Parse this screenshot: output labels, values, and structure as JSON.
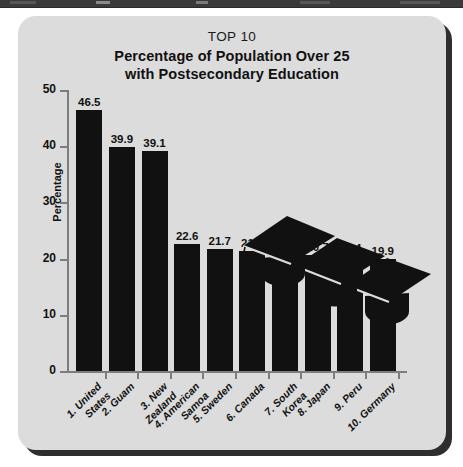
{
  "window": {
    "titlebar_present": true,
    "titlebar_color": "#3a3a3a"
  },
  "card": {
    "background_color": "#dcdcdc",
    "shadow_color": "#2e2e2e"
  },
  "illustration": {
    "name": "graduation-caps",
    "count": 3,
    "color": "#111111"
  },
  "chart_data": {
    "type": "bar",
    "title": "TOP 10",
    "subtitle": "Percentage of Population Over 25\nwith Postsecondary Education",
    "subtitle_line1": "Percentage of Population Over 25",
    "subtitle_line2": "with Postsecondary Education",
    "xlabel": "",
    "ylabel": "Percentage",
    "ylim": [
      0,
      50
    ],
    "yticks": [
      0,
      10,
      20,
      30,
      40,
      50
    ],
    "ytick_labels": [
      "0",
      "10",
      "20",
      "30",
      "40",
      "50"
    ],
    "grid": false,
    "legend": false,
    "bar_color": "#111111",
    "categories": [
      "1. United\nStates",
      "2. Guam",
      "3. New\nZealand",
      "4. American\nSamoa",
      "5. Sweden",
      "6. Canada",
      "7. South\nKorea",
      "8. Japan",
      "9. Peru",
      "10. Germany"
    ],
    "values": [
      46.5,
      39.9,
      39.1,
      22.6,
      21.7,
      21.4,
      21.1,
      20.7,
      20.4,
      19.9
    ],
    "value_labels": [
      "46.5",
      "39.9",
      "39.1",
      "22.6",
      "21.7",
      "21.4",
      "21.1",
      "20.7",
      "20.4",
      "19.9"
    ]
  }
}
